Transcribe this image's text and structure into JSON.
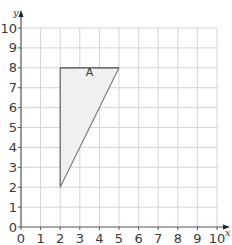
{
  "chart_data": {
    "type": "diagram",
    "title": "",
    "xlabel": "x",
    "ylabel": "y",
    "xlim": [
      0,
      10
    ],
    "ylim": [
      0,
      10
    ],
    "grid": true,
    "x_ticks": [
      "0",
      "1",
      "2",
      "3",
      "4",
      "5",
      "6",
      "7",
      "8",
      "9",
      "10"
    ],
    "y_ticks": [
      "0",
      "1",
      "2",
      "3",
      "4",
      "5",
      "6",
      "7",
      "8",
      "9",
      "10"
    ],
    "shapes": [
      {
        "name": "A",
        "kind": "triangle",
        "vertices": [
          [
            2,
            8
          ],
          [
            5,
            8
          ],
          [
            2,
            2
          ]
        ],
        "fill": "#f0f0f0",
        "stroke_colors": {
          "top": "#444444",
          "left": "#555555",
          "hypotenuse": "#777777"
        },
        "label_position": [
          3.5,
          7.6
        ]
      }
    ]
  },
  "colors": {
    "grid": "#d4d4d4",
    "axis": "#555555",
    "text": "#3a3a3a"
  }
}
